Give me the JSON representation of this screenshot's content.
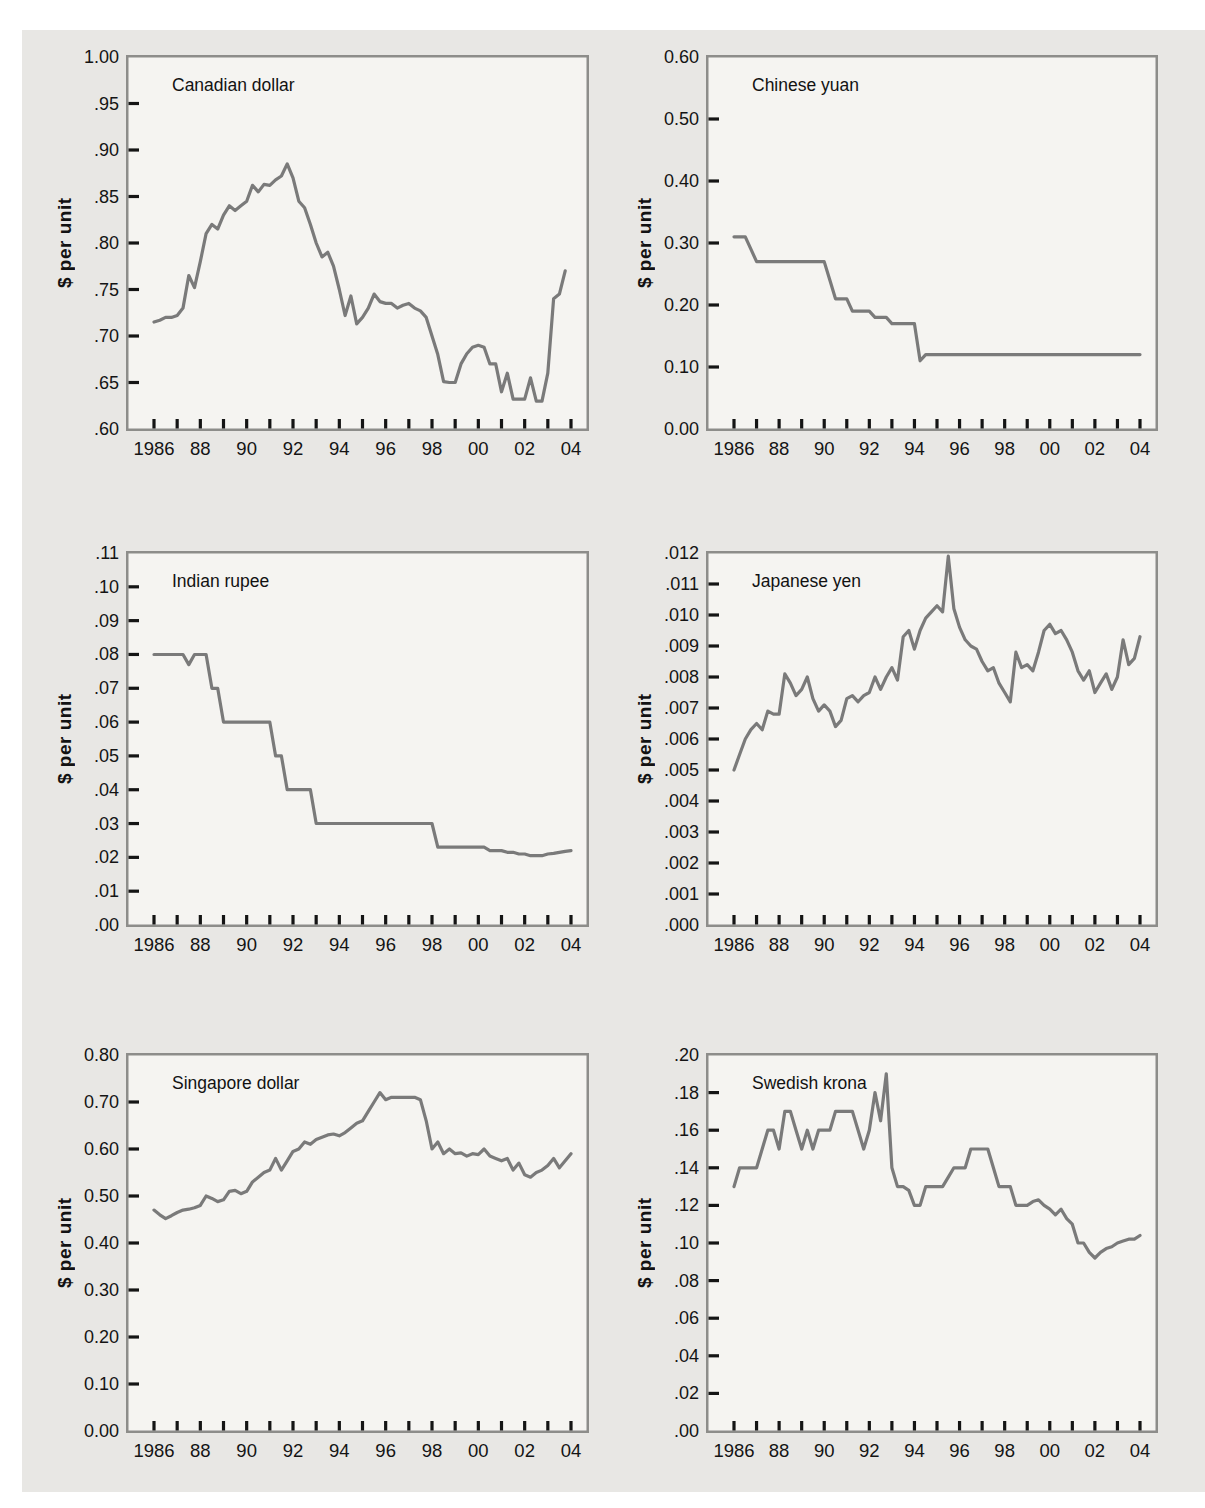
{
  "page": {
    "background": "#ffffff",
    "panel_background": "#e8e7e4",
    "plot_background": "#f5f4f1",
    "line_color": "#7a7a7a",
    "frame_color": "#8d8d8a",
    "tick_color": "#141414"
  },
  "axis": {
    "x_tick_years": [
      1986,
      1987,
      1988,
      1989,
      1990,
      1991,
      1992,
      1993,
      1994,
      1995,
      1996,
      1997,
      1998,
      1999,
      2000,
      2001,
      2002,
      2003,
      2004
    ],
    "x_label_years": [
      1986,
      1988,
      1990,
      1992,
      1994,
      1996,
      1998,
      2000,
      2002,
      2004
    ],
    "x_labels": [
      "1986",
      "88",
      "90",
      "92",
      "94",
      "96",
      "98",
      "00",
      "02",
      "04"
    ]
  },
  "chart_data": [
    {
      "type": "line",
      "title": "Canadian dollar",
      "ylabel": "$ per unit",
      "ylim": [
        0.6,
        1.0
      ],
      "ytick_values": [
        1.0,
        0.95,
        0.9,
        0.85,
        0.8,
        0.75,
        0.7,
        0.65,
        0.6
      ],
      "ytick_labels": [
        "1.00",
        ".95",
        ".90",
        ".85",
        ".80",
        ".75",
        ".70",
        ".65",
        ".60"
      ],
      "x_start": 1986,
      "x_step": 0.25,
      "values": [
        0.715,
        0.717,
        0.72,
        0.72,
        0.722,
        0.73,
        0.765,
        0.752,
        0.78,
        0.81,
        0.82,
        0.815,
        0.83,
        0.84,
        0.835,
        0.84,
        0.845,
        0.862,
        0.855,
        0.863,
        0.862,
        0.868,
        0.872,
        0.885,
        0.87,
        0.845,
        0.838,
        0.82,
        0.8,
        0.785,
        0.79,
        0.775,
        0.75,
        0.722,
        0.743,
        0.713,
        0.72,
        0.73,
        0.745,
        0.737,
        0.735,
        0.735,
        0.73,
        0.733,
        0.735,
        0.73,
        0.727,
        0.72,
        0.7,
        0.68,
        0.651,
        0.65,
        0.65,
        0.67,
        0.681,
        0.688,
        0.69,
        0.688,
        0.67,
        0.67,
        0.64,
        0.66,
        0.632,
        0.632,
        0.632,
        0.655,
        0.63,
        0.63,
        0.66,
        0.74,
        0.745,
        0.77
      ]
    },
    {
      "type": "line",
      "title": "Chinese yuan",
      "ylabel": "$ per unit",
      "ylim": [
        0.0,
        0.6
      ],
      "ytick_values": [
        0.6,
        0.5,
        0.4,
        0.3,
        0.2,
        0.1,
        0.0
      ],
      "ytick_labels": [
        "0.60",
        "0.50",
        "0.40",
        "0.30",
        "0.20",
        "0.10",
        "0.00"
      ],
      "x_start": 1986,
      "x_step": 0.25,
      "values": [
        0.31,
        0.31,
        0.31,
        0.29,
        0.27,
        0.27,
        0.27,
        0.27,
        0.27,
        0.27,
        0.27,
        0.27,
        0.27,
        0.27,
        0.27,
        0.27,
        0.27,
        0.24,
        0.21,
        0.21,
        0.21,
        0.19,
        0.19,
        0.19,
        0.19,
        0.18,
        0.18,
        0.18,
        0.17,
        0.17,
        0.17,
        0.17,
        0.17,
        0.11,
        0.12,
        0.12,
        0.12,
        0.12,
        0.12,
        0.12,
        0.12,
        0.12,
        0.12,
        0.12,
        0.12,
        0.12,
        0.12,
        0.12,
        0.12,
        0.12,
        0.12,
        0.12,
        0.12,
        0.12,
        0.12,
        0.12,
        0.12,
        0.12,
        0.12,
        0.12,
        0.12,
        0.12,
        0.12,
        0.12,
        0.12,
        0.12,
        0.12,
        0.12,
        0.12,
        0.12,
        0.12,
        0.12,
        0.12
      ]
    },
    {
      "type": "line",
      "title": "Indian rupee",
      "ylabel": "$ per unit",
      "ylim": [
        0.0,
        0.11
      ],
      "ytick_values": [
        0.11,
        0.1,
        0.09,
        0.08,
        0.07,
        0.06,
        0.05,
        0.04,
        0.03,
        0.02,
        0.01,
        0.0
      ],
      "ytick_labels": [
        ".11",
        ".10",
        ".09",
        ".08",
        ".07",
        ".06",
        ".05",
        ".04",
        ".03",
        ".02",
        ".01",
        ".00"
      ],
      "x_start": 1986,
      "x_step": 0.25,
      "values": [
        0.08,
        0.08,
        0.08,
        0.08,
        0.08,
        0.08,
        0.077,
        0.08,
        0.08,
        0.08,
        0.07,
        0.07,
        0.06,
        0.06,
        0.06,
        0.06,
        0.06,
        0.06,
        0.06,
        0.06,
        0.06,
        0.05,
        0.05,
        0.04,
        0.04,
        0.04,
        0.04,
        0.04,
        0.03,
        0.03,
        0.03,
        0.03,
        0.03,
        0.03,
        0.03,
        0.03,
        0.03,
        0.03,
        0.03,
        0.03,
        0.03,
        0.03,
        0.03,
        0.03,
        0.03,
        0.03,
        0.03,
        0.03,
        0.03,
        0.023,
        0.023,
        0.023,
        0.023,
        0.023,
        0.023,
        0.023,
        0.023,
        0.023,
        0.022,
        0.022,
        0.022,
        0.0215,
        0.0215,
        0.021,
        0.021,
        0.0205,
        0.0205,
        0.0205,
        0.021,
        0.0212,
        0.0215,
        0.0218,
        0.022
      ]
    },
    {
      "type": "line",
      "title": "Japanese yen",
      "ylabel": "$ per unit",
      "ylim": [
        0.0,
        0.012
      ],
      "ytick_values": [
        0.012,
        0.011,
        0.01,
        0.009,
        0.008,
        0.007,
        0.006,
        0.005,
        0.004,
        0.003,
        0.002,
        0.001,
        0.0
      ],
      "ytick_labels": [
        ".012",
        ".011",
        ".010",
        ".009",
        ".008",
        ".007",
        ".006",
        ".005",
        ".004",
        ".003",
        ".002",
        ".001",
        ".000"
      ],
      "x_start": 1986,
      "x_step": 0.25,
      "values": [
        0.005,
        0.0055,
        0.006,
        0.0063,
        0.0065,
        0.0063,
        0.0069,
        0.0068,
        0.0068,
        0.0081,
        0.0078,
        0.0074,
        0.0076,
        0.008,
        0.0073,
        0.0069,
        0.0071,
        0.0069,
        0.0064,
        0.0066,
        0.0073,
        0.0074,
        0.0072,
        0.0074,
        0.0075,
        0.008,
        0.0076,
        0.008,
        0.0083,
        0.0079,
        0.0093,
        0.0095,
        0.0089,
        0.0095,
        0.0099,
        0.0101,
        0.0103,
        0.0101,
        0.0119,
        0.0102,
        0.0096,
        0.0092,
        0.009,
        0.0089,
        0.0085,
        0.0082,
        0.0083,
        0.0078,
        0.0075,
        0.0072,
        0.0088,
        0.0083,
        0.0084,
        0.0082,
        0.0088,
        0.0095,
        0.0097,
        0.0094,
        0.0095,
        0.0092,
        0.0088,
        0.0082,
        0.0079,
        0.0082,
        0.0075,
        0.0078,
        0.0081,
        0.0076,
        0.008,
        0.0092,
        0.0084,
        0.0086,
        0.0093
      ]
    },
    {
      "type": "line",
      "title": "Singapore dollar",
      "ylabel": "$ per unit",
      "ylim": [
        0.0,
        0.8
      ],
      "ytick_values": [
        0.8,
        0.7,
        0.6,
        0.5,
        0.4,
        0.3,
        0.2,
        0.1,
        0.0
      ],
      "ytick_labels": [
        "0.80",
        "0.70",
        "0.60",
        "0.50",
        "0.40",
        "0.30",
        "0.20",
        "0.10",
        "0.00"
      ],
      "x_start": 1986,
      "x_step": 0.25,
      "values": [
        0.47,
        0.46,
        0.452,
        0.458,
        0.465,
        0.47,
        0.472,
        0.475,
        0.48,
        0.5,
        0.495,
        0.488,
        0.492,
        0.51,
        0.512,
        0.505,
        0.51,
        0.53,
        0.54,
        0.55,
        0.555,
        0.58,
        0.555,
        0.575,
        0.595,
        0.6,
        0.615,
        0.61,
        0.62,
        0.625,
        0.63,
        0.632,
        0.628,
        0.635,
        0.645,
        0.655,
        0.66,
        0.68,
        0.7,
        0.72,
        0.705,
        0.71,
        0.71,
        0.71,
        0.71,
        0.71,
        0.705,
        0.66,
        0.6,
        0.615,
        0.59,
        0.6,
        0.59,
        0.592,
        0.585,
        0.59,
        0.588,
        0.6,
        0.585,
        0.58,
        0.575,
        0.58,
        0.555,
        0.57,
        0.545,
        0.54,
        0.55,
        0.555,
        0.565,
        0.58,
        0.56,
        0.575,
        0.59
      ]
    },
    {
      "type": "line",
      "title": "Swedish krona",
      "ylabel": "$ per unit",
      "ylim": [
        0.0,
        0.2
      ],
      "ytick_values": [
        0.2,
        0.18,
        0.16,
        0.14,
        0.12,
        0.1,
        0.08,
        0.06,
        0.04,
        0.02,
        0.0
      ],
      "ytick_labels": [
        ".20",
        ".18",
        ".16",
        ".14",
        ".12",
        ".10",
        ".08",
        ".06",
        ".04",
        ".02",
        ".00"
      ],
      "x_start": 1986,
      "x_step": 0.25,
      "values": [
        0.13,
        0.14,
        0.14,
        0.14,
        0.14,
        0.15,
        0.16,
        0.16,
        0.15,
        0.17,
        0.17,
        0.16,
        0.15,
        0.16,
        0.15,
        0.16,
        0.16,
        0.16,
        0.17,
        0.17,
        0.17,
        0.17,
        0.16,
        0.15,
        0.16,
        0.18,
        0.165,
        0.19,
        0.14,
        0.13,
        0.13,
        0.128,
        0.12,
        0.12,
        0.13,
        0.13,
        0.13,
        0.13,
        0.135,
        0.14,
        0.14,
        0.14,
        0.15,
        0.15,
        0.15,
        0.15,
        0.14,
        0.13,
        0.13,
        0.13,
        0.12,
        0.12,
        0.12,
        0.122,
        0.123,
        0.12,
        0.118,
        0.115,
        0.118,
        0.113,
        0.11,
        0.1,
        0.1,
        0.095,
        0.092,
        0.095,
        0.097,
        0.098,
        0.1,
        0.101,
        0.102,
        0.102,
        0.104
      ]
    }
  ]
}
